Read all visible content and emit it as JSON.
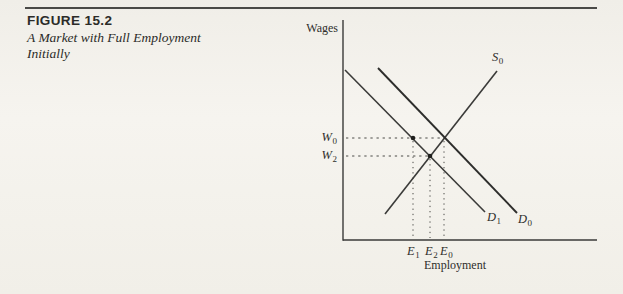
{
  "figure_header": {
    "number": "FIGURE 15.2",
    "caption_line1": "A Market with Full Employment",
    "caption_line2": "Initially"
  },
  "chart_data": {
    "type": "line",
    "title": "",
    "ylabel": "Wages",
    "xlabel": "Employment",
    "description_type": "supply-demand-diagram",
    "axes": {
      "origin": [
        343,
        240
      ],
      "y_top": 20,
      "x_right": 597,
      "color": "#3a3a38",
      "width": 1.4
    },
    "series": [
      {
        "name": "S0",
        "label": {
          "base": "S",
          "sub": "0"
        },
        "kind": "supply",
        "from": [
          385,
          214
        ],
        "to": [
          497,
          71
        ],
        "color": "#3b3b39",
        "width": 1.6
      },
      {
        "name": "D1",
        "label": {
          "base": "D",
          "sub": "1"
        },
        "kind": "demand-shifted",
        "from": [
          345,
          70
        ],
        "to": [
          485,
          212
        ],
        "color": "#3b3b39",
        "width": 1.6
      },
      {
        "name": "D0",
        "label": {
          "base": "D",
          "sub": "0"
        },
        "kind": "demand-initial",
        "from": [
          378,
          68
        ],
        "to": [
          517,
          213
        ],
        "color": "#2d2d2b",
        "width": 1.9
      }
    ],
    "guides": {
      "color": "#4a4a47",
      "width": 1,
      "horizontal": [
        {
          "label": {
            "base": "W",
            "sub": "0"
          },
          "y": 138,
          "x_end": 444
        },
        {
          "label": {
            "base": "W",
            "sub": "2"
          },
          "y": 156,
          "x_end": 430
        }
      ],
      "vertical": [
        {
          "label": {
            "base": "E",
            "sub": "1"
          },
          "x": 413,
          "y_start": 138
        },
        {
          "label": {
            "base": "E",
            "sub": "2"
          },
          "x": 430,
          "y_start": 156
        },
        {
          "label": {
            "base": "E",
            "sub": "0"
          },
          "x": 444,
          "y_start": 138
        }
      ]
    },
    "markers": [
      {
        "x": 413,
        "y": 138,
        "r": 2.3,
        "color": "#1f1f1d"
      },
      {
        "x": 430,
        "y": 156,
        "r": 2.3,
        "color": "#1f1f1d"
      }
    ],
    "key_points": {
      "initial_equilibrium": {
        "wage": "W0",
        "employment": "E0"
      },
      "new_equilibrium_after_demand_shift": {
        "wage": "W2",
        "employment": "E2"
      },
      "employment_at_rigid_wage_W0_on_D1": {
        "wage": "W0",
        "employment": "E1"
      }
    }
  }
}
